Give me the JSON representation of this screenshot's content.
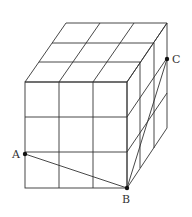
{
  "diagram": {
    "colors": {
      "line": "#333333",
      "background": "#ffffff"
    },
    "points": [
      {
        "label": "A",
        "x": 25,
        "y": 154
      },
      {
        "label": "B",
        "x": 127,
        "y": 188
      },
      {
        "label": "C",
        "x": 167,
        "y": 59
      }
    ],
    "labels": {
      "A": "A",
      "B": "B",
      "C": "C"
    }
  }
}
